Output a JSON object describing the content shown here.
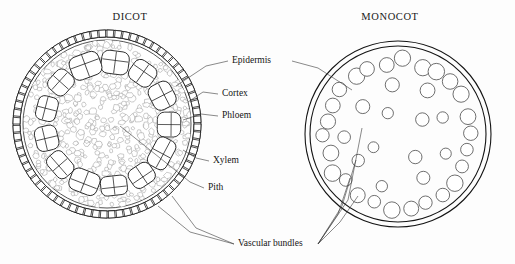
{
  "figure": {
    "background_color": "#fdfdfd",
    "ink_color": "#141414",
    "width": 515,
    "height": 264
  },
  "titles": {
    "left": "DICOT",
    "right": "MONOCOT",
    "left_x": 130,
    "left_y": 20,
    "right_x": 390,
    "right_y": 20
  },
  "labels": [
    {
      "id": "epidermis",
      "text": "Epidermis",
      "x": 232,
      "y": 63,
      "anchor": "start"
    },
    {
      "id": "cortex",
      "text": "Cortex",
      "x": 222,
      "y": 96,
      "anchor": "start"
    },
    {
      "id": "phloem",
      "text": "Phloem",
      "x": 222,
      "y": 118,
      "anchor": "start"
    },
    {
      "id": "xylem",
      "text": "Xylem",
      "x": 213,
      "y": 163,
      "anchor": "start"
    },
    {
      "id": "pith",
      "text": "Pith",
      "x": 208,
      "y": 190,
      "anchor": "start"
    },
    {
      "id": "vascular-bundles",
      "text": "Vascular bundles",
      "x": 238,
      "y": 246,
      "anchor": "start"
    }
  ],
  "dicot": {
    "name": "dicot-stem-cross-section",
    "center_x": 107,
    "center_y": 124,
    "outer_radius": 94,
    "epidermis_inner_radius": 87,
    "epidermis_cell_count": 72,
    "cortex_ring_radius": 84,
    "bundle_ring_radius": 62,
    "bundle_count": 13,
    "bundle_rx": 14,
    "bundle_ry": 11,
    "ground_cell_count": 520,
    "tissue_layers": [
      "epidermis",
      "cortex",
      "phloem",
      "xylem",
      "pith"
    ]
  },
  "monocot": {
    "name": "monocot-stem-cross-section",
    "center_x": 398,
    "center_y": 134,
    "outer_radius": 93,
    "inner_radius": 88,
    "epidermis_gap": 5,
    "outer_bundle_ring_radius": 73,
    "outer_bundle_count": 26,
    "outer_bundle_r": 7.2,
    "mid_bundle_ring_radius": 50,
    "mid_bundle_count": 9,
    "mid_bundle_r": 6.4,
    "inner_bundle_ring_radius": 25,
    "inner_bundle_count": 4,
    "inner_bundle_r": 6.0,
    "arrangement": "scattered"
  },
  "leaders": {
    "epidermis_left": [
      [
        228,
        61
      ],
      [
        206,
        66
      ],
      [
        176,
        86
      ]
    ],
    "epidermis_right": [
      [
        292,
        61
      ],
      [
        318,
        68
      ],
      [
        352,
        90
      ]
    ],
    "cortex": [
      [
        218,
        94
      ],
      [
        203,
        92
      ],
      [
        188,
        102
      ]
    ],
    "phloem": [
      [
        218,
        116
      ],
      [
        201,
        114
      ],
      [
        183,
        120
      ]
    ],
    "xylem": [
      [
        209,
        161
      ],
      [
        196,
        158
      ],
      [
        183,
        150
      ]
    ],
    "pith": [
      [
        204,
        188
      ],
      [
        190,
        182
      ],
      [
        120,
        126
      ]
    ],
    "vb_dicot_1": [
      [
        234,
        244
      ],
      [
        190,
        232
      ],
      [
        158,
        206
      ]
    ],
    "vb_dicot_2": [
      [
        234,
        244
      ],
      [
        196,
        228
      ],
      [
        172,
        196
      ]
    ],
    "vb_mono_1": [
      [
        318,
        244
      ],
      [
        340,
        222
      ],
      [
        358,
        196
      ]
    ],
    "vb_mono_2": [
      [
        318,
        244
      ],
      [
        338,
        214
      ],
      [
        350,
        178
      ]
    ],
    "vb_mono_3": [
      [
        318,
        244
      ],
      [
        342,
        206
      ],
      [
        356,
        160
      ]
    ],
    "vb_mono_4": [
      [
        318,
        244
      ],
      [
        348,
        200
      ],
      [
        362,
        128
      ]
    ]
  },
  "chart_data": {
    "type": "diagram",
    "panels": [
      {
        "name": "DICOT",
        "structures": [
          "Epidermis",
          "Cortex",
          "Phloem",
          "Xylem",
          "Pith",
          "Vascular bundles"
        ],
        "vascular_bundle_count": 13,
        "vascular_bundle_arrangement": "ring"
      },
      {
        "name": "MONOCOT",
        "structures": [
          "Vascular bundles"
        ],
        "vascular_bundle_count": 39,
        "vascular_bundle_arrangement": "scattered"
      }
    ]
  }
}
